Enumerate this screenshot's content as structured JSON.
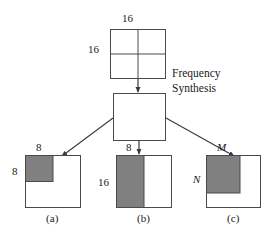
{
  "figure": {
    "colors": {
      "stroke": "#4a4a4a",
      "shade": "#808080",
      "text": "#1a1a1a",
      "background": "#ffffff"
    },
    "process": {
      "label": "Frequency\nSynthesis"
    },
    "source_block": {
      "top_label": "16",
      "left_label": "16",
      "grid": "2x2"
    },
    "synthesis_block": {
      "grid": "none"
    },
    "panels": [
      {
        "caption": "(a)",
        "top_label": "8",
        "left_label": "8",
        "shade_width_frac": 0.5,
        "shade_height_frac": 0.5,
        "italic_labels": false
      },
      {
        "caption": "(b)",
        "top_label": "8",
        "left_label": "16",
        "shade_width_frac": 0.5,
        "shade_height_frac": 1.0,
        "italic_labels": false
      },
      {
        "caption": "(c)",
        "top_label": "M",
        "left_label": "N",
        "shade_width_frac": 0.62,
        "shade_height_frac": 0.72,
        "italic_labels": true
      }
    ]
  }
}
